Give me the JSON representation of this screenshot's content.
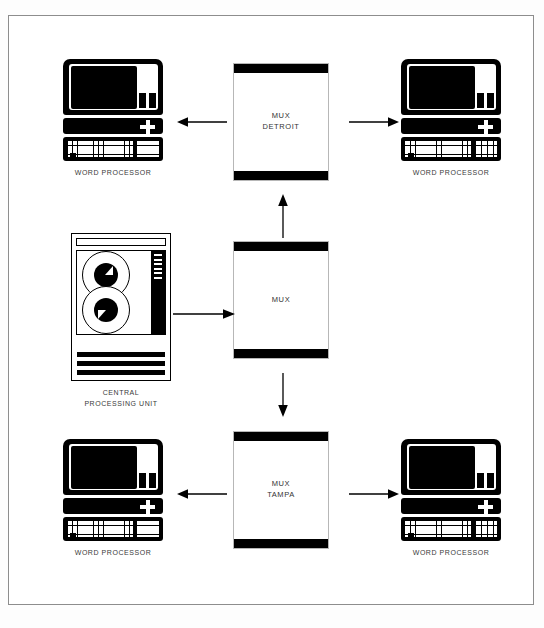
{
  "diagram": {
    "frame": {
      "border_color": "#8d8d8d",
      "background": "#ffffff"
    },
    "colors": {
      "ink": "#000000",
      "text": "#333333",
      "frame": "#8d8d8d"
    },
    "nodes": [
      {
        "id": "wp-top-left",
        "type": "word-processor",
        "caption": "WORD PROCESSOR",
        "position": {
          "left": 62,
          "top": 58
        }
      },
      {
        "id": "mux-detroit",
        "type": "mux",
        "label": "MUX\nDETROIT",
        "position": {
          "left": 232,
          "top": 62
        }
      },
      {
        "id": "wp-top-right",
        "type": "word-processor",
        "caption": "WORD PROCESSOR",
        "position": {
          "left": 400,
          "top": 58
        }
      },
      {
        "id": "cpu",
        "type": "central-processing-unit",
        "caption": "CENTRAL\nPROCESSING UNIT",
        "position": {
          "left": 70,
          "top": 232
        },
        "lights_count": 6,
        "reels_count": 2,
        "bars_count": 3
      },
      {
        "id": "mux-center",
        "type": "mux",
        "label": "MUX",
        "position": {
          "left": 232,
          "top": 240
        }
      },
      {
        "id": "wp-bottom-left",
        "type": "word-processor",
        "caption": "WORD PROCESSOR",
        "position": {
          "left": 62,
          "top": 438
        }
      },
      {
        "id": "mux-tampa",
        "type": "mux",
        "label": "MUX\nTAMPA",
        "position": {
          "left": 232,
          "top": 430
        }
      },
      {
        "id": "wp-bottom-right",
        "type": "word-processor",
        "caption": "WORD PROCESSOR",
        "position": {
          "left": 400,
          "top": 438
        }
      }
    ],
    "connections": [
      {
        "id": "detroit-to-wp-left",
        "from": "mux-detroit",
        "to": "wp-top-left",
        "direction": "left",
        "position": {
          "left": 176,
          "top": 115
        },
        "length": 48
      },
      {
        "id": "detroit-to-wp-right",
        "from": "mux-detroit",
        "to": "wp-top-right",
        "direction": "right",
        "position": {
          "left": 348,
          "top": 115
        },
        "length": 48
      },
      {
        "id": "mux-to-detroit",
        "from": "mux-center",
        "to": "mux-detroit",
        "direction": "up",
        "position": {
          "left": 276,
          "top": 193
        },
        "length": 42
      },
      {
        "id": "cpu-to-mux",
        "from": "cpu",
        "to": "mux-center",
        "direction": "right",
        "position": {
          "left": 172,
          "top": 297
        },
        "length": 58
      },
      {
        "id": "mux-to-tampa",
        "from": "mux-center",
        "to": "mux-tampa",
        "direction": "down",
        "position": {
          "left": 276,
          "top": 372
        },
        "length": 42
      },
      {
        "id": "tampa-to-wp-left",
        "from": "mux-tampa",
        "to": "wp-bottom-left",
        "direction": "left",
        "position": {
          "left": 176,
          "top": 487
        },
        "length": 48
      },
      {
        "id": "tampa-to-wp-right",
        "from": "mux-tampa",
        "to": "wp-bottom-right",
        "direction": "right",
        "position": {
          "left": 348,
          "top": 487
        },
        "length": 48
      }
    ]
  }
}
